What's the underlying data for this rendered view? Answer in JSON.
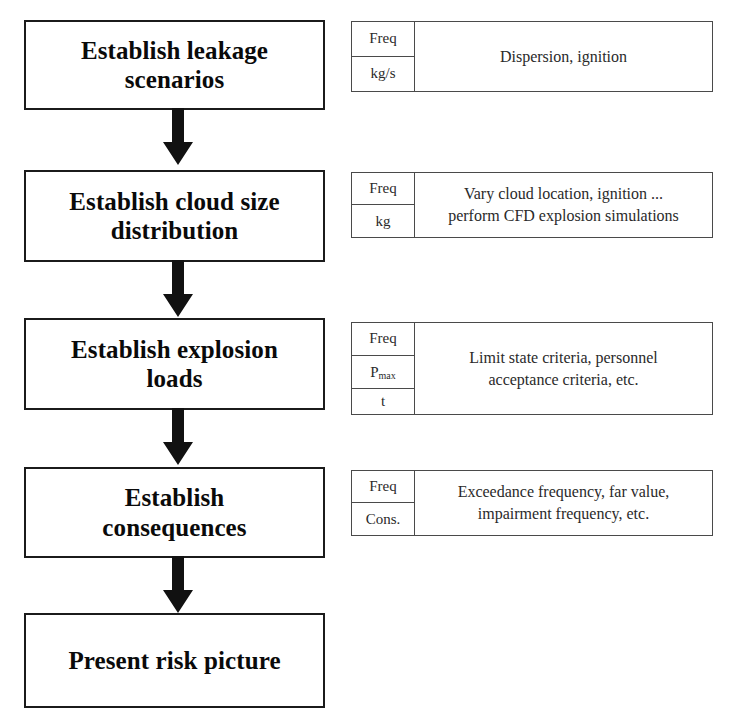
{
  "diagram": {
    "type": "flowchart",
    "orientation": "top-to-bottom",
    "colors": {
      "box_border": "#1b1b1b",
      "table_border": "#4a4a4a",
      "text": "#0a0a0a",
      "background": "#ffffff",
      "arrow": "#111111"
    },
    "steps": [
      {
        "id": "step-1",
        "label": "Establish leakage\nscenarios",
        "note": {
          "units": [
            "Freq",
            "kg/s"
          ],
          "description": "Dispersion, ignition"
        }
      },
      {
        "id": "step-2",
        "label": "Establish cloud size\ndistribution",
        "note": {
          "units": [
            "Freq",
            "kg"
          ],
          "description": "Vary cloud location, ignition ...\nperform CFD explosion simulations"
        }
      },
      {
        "id": "step-3",
        "label": "Establish explosion\nloads",
        "note": {
          "units": [
            "Freq",
            "Pmax",
            "t"
          ],
          "units_rendered": [
            "Freq",
            "P",
            "t"
          ],
          "subscripts": [
            "",
            "max",
            ""
          ],
          "description": "Limit state criteria, personnel\nacceptance criteria, etc."
        }
      },
      {
        "id": "step-4",
        "label": "Establish\nconsequences",
        "note": {
          "units": [
            "Freq",
            "Cons."
          ],
          "description": "Exceedance frequency, far value,\nimpairment frequency, etc."
        }
      },
      {
        "id": "step-5",
        "label": "Present risk picture",
        "note": null
      }
    ],
    "connectors": [
      {
        "id": "arrow-1",
        "from": "step-1",
        "to": "step-2",
        "shape": "down-arrow"
      },
      {
        "id": "arrow-2",
        "from": "step-2",
        "to": "step-3",
        "shape": "down-arrow"
      },
      {
        "id": "arrow-3",
        "from": "step-3",
        "to": "step-4",
        "shape": "down-arrow"
      },
      {
        "id": "arrow-4",
        "from": "step-4",
        "to": "step-5",
        "shape": "down-arrow"
      }
    ]
  }
}
